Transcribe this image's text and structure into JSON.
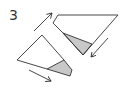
{
  "diagram": {
    "step_number": "3",
    "colors": {
      "line": "#333333",
      "shade": "#c8c8c8",
      "background": "#ffffff"
    },
    "shapes": [
      {
        "name": "upper-folded-paper",
        "outline": "58,15 118,15 83,55 63,33 53,23",
        "shaded": "63,33 92,44 83,55"
      },
      {
        "name": "lower-folded-paper",
        "outline": "42,35 17,60 47,69 64,60 72,70 70,76 47,69",
        "shaded": "47,69 64,60 72,70 70,76"
      }
    ],
    "arrows": [
      {
        "name": "arrow-up-right",
        "from": [
          34,
          31
        ],
        "to": [
          52,
          13
        ]
      },
      {
        "name": "arrow-down-left",
        "from": [
          108,
          38
        ],
        "to": [
          91,
          57
        ]
      },
      {
        "name": "arrow-down-right",
        "from": [
          29,
          70
        ],
        "to": [
          51,
          81
        ]
      }
    ]
  }
}
